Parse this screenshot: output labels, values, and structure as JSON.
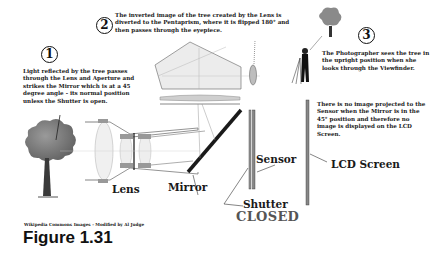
{
  "steps": [
    {
      "number": "1",
      "text": "Light reflected by the tree passes through the Lens and Aperture and strikes the Mirror which is at a 45 degree angle - its normal position unless the Shutter is open."
    },
    {
      "number": "2",
      "text": "The inverted image of the tree created by the Lens is diverted to the Pentaprism, where it is flipped 180° and then passes through the eyepiece."
    },
    {
      "number": "3",
      "text": "The Photographer sees the tree in the upright position when she looks through the Viewfinder."
    }
  ],
  "note": "There is no image projected to the Sensor when the Mirror is in the 45° position and therefore no image is displayed on the LCD Screen.",
  "labels": {
    "lens": "Lens",
    "mirror": "Mirror",
    "sensor": "Sensor",
    "shutter": "Shutter",
    "shutter_state": "CLOSED",
    "lcd": "LCD Screen"
  },
  "credit": "Wikipedia Commons Images - Modified by Al Judge",
  "figure": "Figure 1.31"
}
